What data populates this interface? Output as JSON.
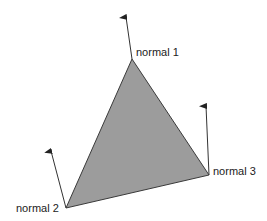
{
  "diagram": {
    "type": "triangle-vertex-normals",
    "colors": {
      "face_fill": "#9c9c9c",
      "edge": "#3a3a3a",
      "arrow": "#333333",
      "background": "#ffffff"
    },
    "vertices": [
      {
        "id": "v1",
        "label": "normal 1"
      },
      {
        "id": "v2",
        "label": "normal 2"
      },
      {
        "id": "v3",
        "label": "normal 3"
      }
    ]
  }
}
